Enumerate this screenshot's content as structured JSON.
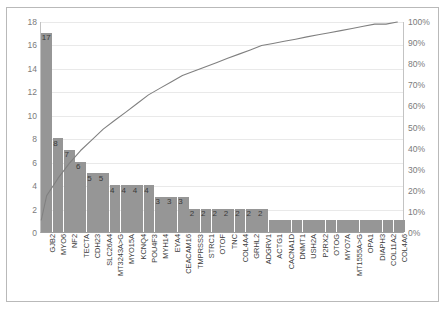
{
  "chart_data": {
    "type": "bar",
    "title": "",
    "subtitle": "",
    "xlabel": "",
    "ylabel": "",
    "y2label": "",
    "ylim": [
      0,
      18
    ],
    "y2lim": [
      0,
      100
    ],
    "grid": true,
    "legend": null,
    "legend_position": "none",
    "bar_color": "#969696",
    "line_color": "#808080",
    "categories": [
      "GJB2",
      "MYO6",
      "NF2",
      "TECTA",
      "CDH23",
      "SLC26A4",
      "MT3243A>G",
      "MYO15A",
      "KCNQ4",
      "POU4F3",
      "MYH14",
      "EYA4",
      "CEACAM16",
      "TMPRSS3",
      "STRC1",
      "OTOF",
      "TNC",
      "COL4A4",
      "GRHL2",
      "ADGRV1",
      "ACTG1",
      "CACNA1D",
      "DNMT1",
      "USH2A",
      "P2RX2",
      "OTOG",
      "MYO7A",
      "MT1555A>G",
      "OPA1",
      "DIAPH3",
      "COL11A2",
      "COL4A6"
    ],
    "values": [
      17,
      8,
      7,
      6,
      5,
      5,
      4,
      4,
      4,
      4,
      3,
      3,
      3,
      2,
      2,
      2,
      2,
      2,
      2,
      2,
      1,
      1,
      1,
      1,
      1,
      1,
      1,
      1,
      1,
      1,
      1,
      1
    ],
    "cumulative_percent": [
      17.3,
      25.5,
      32.7,
      38.8,
      43.9,
      49.0,
      53.1,
      57.1,
      61.2,
      65.3,
      68.4,
      71.4,
      74.5,
      76.5,
      78.6,
      80.6,
      82.7,
      84.7,
      86.7,
      88.8,
      89.8,
      90.8,
      91.8,
      92.9,
      93.9,
      94.9,
      95.9,
      96.9,
      98.0,
      99.0,
      99.0,
      100.0
    ],
    "total": 98,
    "y_ticks": [
      0,
      2,
      4,
      6,
      8,
      10,
      12,
      14,
      16,
      18
    ],
    "y2_ticks": [
      "0%",
      "10%",
      "20%",
      "30%",
      "40%",
      "50%",
      "60%",
      "70%",
      "80%",
      "90%",
      "100%"
    ],
    "series": [
      {
        "name": "Count",
        "type": "bar",
        "values": [
          17,
          8,
          7,
          6,
          5,
          5,
          4,
          4,
          4,
          4,
          3,
          3,
          3,
          2,
          2,
          2,
          2,
          2,
          2,
          2,
          1,
          1,
          1,
          1,
          1,
          1,
          1,
          1,
          1,
          1,
          1,
          1
        ]
      },
      {
        "name": "Cumulative %",
        "type": "line",
        "values": [
          17.3,
          25.5,
          32.7,
          38.8,
          43.9,
          49.0,
          53.1,
          57.1,
          61.2,
          65.3,
          68.4,
          71.4,
          74.5,
          76.5,
          78.6,
          80.6,
          82.7,
          84.7,
          86.7,
          88.8,
          89.8,
          90.8,
          91.8,
          92.9,
          93.9,
          94.9,
          95.9,
          96.9,
          98.0,
          99.0,
          99.0,
          100.0
        ]
      }
    ]
  }
}
